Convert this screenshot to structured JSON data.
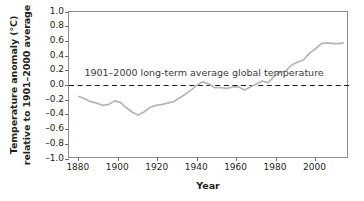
{
  "chart_data": {
    "type": "line",
    "title": "",
    "xlabel": "Year",
    "ylabel_line1": "Temperature anomaly (°C)",
    "ylabel_line2": "relative to 1901–2000 average",
    "xlim": [
      1875,
      2017
    ],
    "ylim": [
      -1.0,
      1.0
    ],
    "grid": false,
    "legend": "none",
    "x_ticks": [
      "1880",
      "1900",
      "1920",
      "1940",
      "1960",
      "1980",
      "2000"
    ],
    "x_tick_values": [
      1880,
      1900,
      1920,
      1940,
      1960,
      1980,
      2000
    ],
    "y_ticks": [
      "1.0",
      "0.8",
      "0.6",
      "0.4",
      "0.2",
      "0.0",
      "–0.2",
      "–0.4",
      "–0.6",
      "–0.8",
      "–1.0"
    ],
    "y_tick_values": [
      1.0,
      0.8,
      0.6,
      0.4,
      0.2,
      0.0,
      -0.2,
      -0.4,
      -0.6,
      -0.8,
      -1.0
    ],
    "annotations": [
      {
        "text": "1901–2000 long-term average global temperature",
        "x": 1944,
        "y": 0.15
      }
    ],
    "reference_line": {
      "name": "1901–2000 long-term average",
      "value": 0.0,
      "style": "dashed",
      "color": "#1a1a1a"
    },
    "series": [
      {
        "name": "Global temperature anomaly",
        "color": "#b5b5b5",
        "x": [
          1880,
          1883,
          1886,
          1889,
          1892,
          1895,
          1898,
          1901,
          1904,
          1907,
          1910,
          1913,
          1916,
          1919,
          1922,
          1925,
          1928,
          1931,
          1934,
          1937,
          1940,
          1943,
          1946,
          1949,
          1952,
          1955,
          1958,
          1961,
          1964,
          1967,
          1970,
          1973,
          1976,
          1979,
          1982,
          1985,
          1988,
          1991,
          1994,
          1997,
          2000,
          2003,
          2006,
          2009,
          2012,
          2014
        ],
        "y": [
          -0.15,
          -0.18,
          -0.22,
          -0.24,
          -0.27,
          -0.26,
          -0.21,
          -0.23,
          -0.3,
          -0.36,
          -0.4,
          -0.36,
          -0.3,
          -0.27,
          -0.26,
          -0.24,
          -0.22,
          -0.17,
          -0.12,
          -0.06,
          0.01,
          0.05,
          0.02,
          -0.03,
          -0.03,
          -0.04,
          -0.02,
          -0.02,
          -0.06,
          -0.02,
          0.02,
          0.06,
          0.04,
          0.12,
          0.18,
          0.2,
          0.28,
          0.32,
          0.35,
          0.44,
          0.5,
          0.57,
          0.58,
          0.57,
          0.57,
          0.58
        ]
      }
    ]
  },
  "axes": {
    "frame_color": "#8d8d8d",
    "tick_color": "#6f6f6f"
  }
}
